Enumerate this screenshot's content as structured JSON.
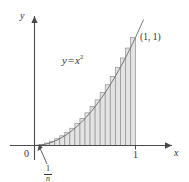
{
  "figure": {
    "kind": "riemann-sum-diagram",
    "axes": {
      "y_label": "y",
      "x_label": "x",
      "origin_label": "0",
      "x_tick_label": "1"
    },
    "curve": {
      "label_y": "y",
      "label_eq": "=",
      "label_x": "x",
      "label_exp": "2",
      "full": "y = x²"
    },
    "point": {
      "label": "(1, 1)"
    },
    "width_annotation": {
      "numerator": "1",
      "denominator": "n",
      "full": "1/n"
    },
    "colors": {
      "axis": "#4a4a4a",
      "curve": "#6b6b6b",
      "rectangle_fill": "#e3e3e3",
      "rectangle_stroke": "#8a8a8a",
      "text": "#333333",
      "background": "#ffffff"
    }
  },
  "chart_data": {
    "type": "area",
    "title": "",
    "subtitle": "",
    "xlabel": "x",
    "ylabel": "y",
    "xlim": [
      0,
      1
    ],
    "ylim": [
      0,
      1
    ],
    "grid": false,
    "legend": "none",
    "function": "y = x^2",
    "annotations": [
      {
        "text": "y = x²",
        "x": 0.32,
        "y": 0.74
      },
      {
        "text": "(1, 1)",
        "x": 1.02,
        "y": 1.02
      },
      {
        "text": "1/n",
        "x": 0.05,
        "y": -0.22
      },
      {
        "text": "0",
        "x": -0.05,
        "y": -0.08
      },
      {
        "text": "1",
        "x": 1.0,
        "y": -0.08
      }
    ],
    "riemann": {
      "method": "left-endpoint-inscribed",
      "n": 20,
      "rect_width": 0.05,
      "x_left_edges": [
        0.0,
        0.05,
        0.1,
        0.15,
        0.2,
        0.25,
        0.3,
        0.35,
        0.4,
        0.45,
        0.5,
        0.55,
        0.6,
        0.65,
        0.7,
        0.75,
        0.8,
        0.85,
        0.9,
        0.95
      ],
      "heights": [
        0.0025,
        0.01,
        0.0225,
        0.04,
        0.0625,
        0.09,
        0.1225,
        0.16,
        0.2025,
        0.25,
        0.3025,
        0.36,
        0.4225,
        0.49,
        0.5625,
        0.64,
        0.7225,
        0.81,
        0.9025,
        1.0
      ]
    },
    "series": [
      {
        "name": "y = x^2",
        "x": [
          0.0,
          0.05,
          0.1,
          0.15,
          0.2,
          0.25,
          0.3,
          0.35,
          0.4,
          0.45,
          0.5,
          0.55,
          0.6,
          0.65,
          0.7,
          0.75,
          0.8,
          0.85,
          0.9,
          0.95,
          1.0,
          1.08
        ],
        "values": [
          0.0,
          0.0025,
          0.01,
          0.0225,
          0.04,
          0.0625,
          0.09,
          0.1225,
          0.16,
          0.2025,
          0.25,
          0.3025,
          0.36,
          0.4225,
          0.49,
          0.5625,
          0.64,
          0.7225,
          0.81,
          0.9025,
          1.0,
          1.1664
        ]
      }
    ]
  }
}
